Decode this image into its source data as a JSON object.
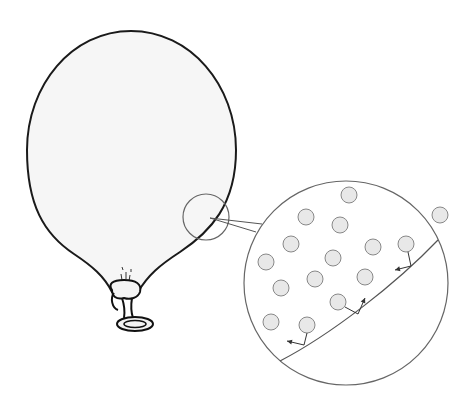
{
  "figure": {
    "colors": {
      "background": "#ffffff",
      "balloon_fill": "#f6f6f6",
      "balloon_outline": "#1a1a1a",
      "magnifier_outline": "#666666",
      "particle_fill": "#e8e8e8",
      "particle_outline": "#888888",
      "wall_line": "#555555",
      "arrow": "#333333"
    },
    "balloon": {
      "cx": 131,
      "cy": 140,
      "rx": 104,
      "ry": 110,
      "knot": {
        "x": 118,
        "y": 290
      }
    },
    "magnifier_small": {
      "cx": 206,
      "cy": 217,
      "r": 23
    },
    "magnifier_large": {
      "cx": 346,
      "cy": 283,
      "r": 102
    },
    "wall": {
      "x1": 280,
      "y1": 361,
      "x2": 438,
      "y2": 240
    },
    "particles": [
      {
        "x": 349,
        "y": 195
      },
      {
        "x": 306,
        "y": 217
      },
      {
        "x": 440,
        "y": 215
      },
      {
        "x": 340,
        "y": 225
      },
      {
        "x": 291,
        "y": 244
      },
      {
        "x": 373,
        "y": 247
      },
      {
        "x": 406,
        "y": 244
      },
      {
        "x": 266,
        "y": 262
      },
      {
        "x": 333,
        "y": 258
      },
      {
        "x": 315,
        "y": 279
      },
      {
        "x": 365,
        "y": 277
      },
      {
        "x": 281,
        "y": 288
      },
      {
        "x": 338,
        "y": 302
      },
      {
        "x": 271,
        "y": 322
      },
      {
        "x": 307,
        "y": 325
      }
    ],
    "collisions": [
      {
        "from": {
          "x": 307,
          "y": 333
        },
        "hit": {
          "x": 304,
          "y": 345
        },
        "to": {
          "x": 287,
          "y": 341
        }
      },
      {
        "from": {
          "x": 345,
          "y": 307
        },
        "hit": {
          "x": 358,
          "y": 314
        },
        "to": {
          "x": 365,
          "y": 298
        }
      },
      {
        "from": {
          "x": 408,
          "y": 252
        },
        "hit": {
          "x": 411,
          "y": 266
        },
        "to": {
          "x": 395,
          "y": 270
        }
      }
    ]
  }
}
